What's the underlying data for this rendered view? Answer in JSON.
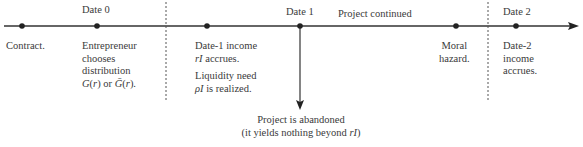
{
  "timeline": {
    "date_labels": {
      "date0": "Date 0",
      "date1": "Date 1",
      "date2": "Date 2"
    },
    "branch_label": "Project continued",
    "events": [
      {
        "id": "contract",
        "lines": [
          "Contract."
        ]
      },
      {
        "id": "entrepreneur",
        "lines": [
          "Entrepreneur",
          "chooses",
          "distribution",
          "G(r) or Ḡ(r)."
        ]
      },
      {
        "id": "date1-income",
        "lines": [
          "Date-1 income",
          "rI accrues."
        ]
      },
      {
        "id": "liquidity",
        "lines": [
          "Liquidity need",
          "ρI is realized."
        ]
      },
      {
        "id": "moral-hazard",
        "lines": [
          "Moral",
          "hazard."
        ]
      },
      {
        "id": "date2-income",
        "lines": [
          "Date-2",
          "income",
          "accrues."
        ]
      }
    ],
    "abandon": {
      "line1": "Project is abandoned",
      "line2_prefix": "(it yields nothing beyond ",
      "line2_var": "rI",
      "line2_suffix": ")"
    },
    "colors": {
      "line": "#333333",
      "dot": "#222222",
      "dashed": "#555555",
      "text": "#3a3a3a"
    }
  }
}
